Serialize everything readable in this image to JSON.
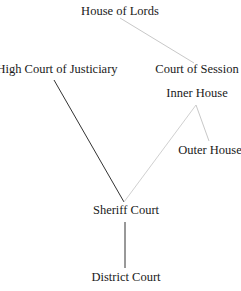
{
  "diagram": {
    "nodes": [
      {
        "id": "lords",
        "label": "House of Lords",
        "x": 120,
        "y": 4
      },
      {
        "id": "hcj",
        "label": "High Court of Justiciary",
        "x": 57,
        "y": 62
      },
      {
        "id": "cos",
        "label": "Court of Session",
        "x": 197,
        "y": 62
      },
      {
        "id": "inner",
        "label": "Inner House",
        "x": 197,
        "y": 86
      },
      {
        "id": "outer",
        "label": "Outer House",
        "x": 210,
        "y": 143
      },
      {
        "id": "sheriff",
        "label": "Sheriff Court",
        "x": 126,
        "y": 203
      },
      {
        "id": "district",
        "label": "District Court",
        "x": 126,
        "y": 270
      }
    ],
    "edges": [
      {
        "from": "lords",
        "to": "cos",
        "color": "#c8c8c8"
      },
      {
        "from": "hcj",
        "to": "sheriff",
        "color": "#333333"
      },
      {
        "from": "inner",
        "to": "sheriff",
        "color": "#d0d0d0"
      },
      {
        "from": "inner",
        "to": "outer",
        "color": "#c8c8c8"
      },
      {
        "from": "sheriff",
        "to": "district",
        "color": "#333333"
      }
    ]
  }
}
